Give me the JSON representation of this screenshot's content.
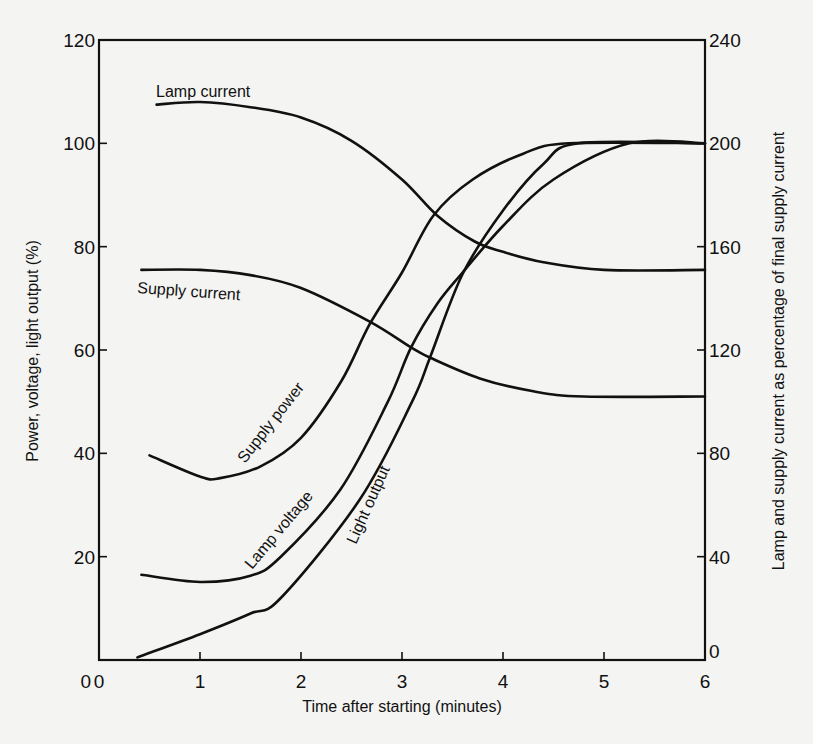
{
  "chart_data": {
    "type": "line",
    "title": "",
    "xlabel": "Time after starting (minutes)",
    "ylabel": "Power, voltage, light output (%)",
    "y2label": "Lamp and supply current as percentage of final supply current",
    "xlim": [
      0,
      6
    ],
    "ylim": [
      0,
      120
    ],
    "y2lim": [
      0,
      240
    ],
    "x_ticks": [
      "0",
      "1",
      "2",
      "3",
      "4",
      "5",
      "6"
    ],
    "x_tick_values": [
      0,
      1,
      2,
      3,
      4,
      5,
      6
    ],
    "y_ticks": [
      "0",
      "20",
      "40",
      "60",
      "80",
      "100",
      "120"
    ],
    "y_tick_values": [
      0,
      20,
      40,
      60,
      80,
      100,
      120
    ],
    "y2_ticks": [
      "0",
      "40",
      "80",
      "120",
      "160",
      "200",
      "240"
    ],
    "y2_tick_values": [
      0,
      40,
      80,
      120,
      160,
      200,
      240
    ],
    "grid": false,
    "legend": "none (inline curve labels)",
    "series": [
      {
        "name": "Lamp current",
        "axis": "right",
        "x": [
          0.57,
          1.0,
          1.5,
          2.0,
          2.5,
          3.0,
          3.35,
          3.72,
          4.0,
          4.4,
          5.0,
          6.0
        ],
        "values": [
          215,
          216,
          214,
          210,
          201,
          186,
          172,
          162,
          158,
          154,
          151,
          151
        ]
      },
      {
        "name": "Supply current",
        "axis": "right",
        "x": [
          0.42,
          1.0,
          1.5,
          2.0,
          2.68,
          3.09,
          3.28,
          3.77,
          4.3,
          4.8,
          6.0
        ],
        "values": [
          151,
          151,
          149,
          144,
          131,
          121,
          117,
          109,
          104,
          102,
          102
        ]
      },
      {
        "name": "Supply power",
        "axis": "left",
        "x": [
          0.5,
          1.0,
          1.2,
          1.6,
          2.0,
          2.4,
          2.68,
          3.0,
          3.31,
          3.7,
          4.2,
          4.65,
          6.0
        ],
        "values": [
          39.6,
          35.5,
          35.2,
          37.5,
          43,
          54,
          65,
          75,
          86,
          93,
          98,
          100,
          100
        ]
      },
      {
        "name": "Lamp voltage",
        "axis": "left",
        "x": [
          0.42,
          1.0,
          1.5,
          1.8,
          2.39,
          2.86,
          3.09,
          3.35,
          3.6,
          4.0,
          4.5,
          5.25,
          6.0
        ],
        "values": [
          16.5,
          15.1,
          16.3,
          20,
          33,
          50,
          60.5,
          69,
          75,
          84,
          93,
          100,
          100
        ]
      },
      {
        "name": "Light output",
        "axis": "left",
        "x": [
          0.38,
          1.0,
          1.5,
          1.8,
          2.58,
          3.1,
          3.28,
          3.6,
          4.0,
          4.4,
          4.75,
          6.0
        ],
        "values": [
          0.5,
          5,
          9,
          12,
          31,
          50,
          58.7,
          74.7,
          87,
          96,
          100,
          100
        ]
      }
    ],
    "annotations": [
      {
        "text": "Lamp current",
        "series": "Lamp current"
      },
      {
        "text": "Supply current",
        "series": "Supply current"
      },
      {
        "text": "Supply power",
        "series": "Supply power"
      },
      {
        "text": "Lamp voltage",
        "series": "Lamp voltage"
      },
      {
        "text": "Light output",
        "series": "Light output"
      }
    ]
  }
}
